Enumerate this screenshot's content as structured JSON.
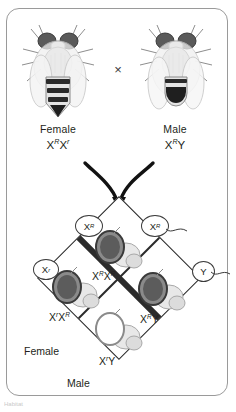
{
  "figure": {
    "cross_symbol": "×",
    "caption_fragment": "Habitat"
  },
  "parents": {
    "female": {
      "sex_label": "Female",
      "allele1": "X",
      "sup1": "R",
      "allele2": "X",
      "sup2": "r",
      "eye_color": "#4a4a4a",
      "icon": "fruit-fly-female"
    },
    "male": {
      "sex_label": "Male",
      "allele1": "X",
      "sup1": "R",
      "allele2": "Y",
      "sup2": "",
      "eye_color": "#4a4a4a",
      "icon": "fruit-fly-male"
    }
  },
  "punnett": {
    "gametes": {
      "top_left": {
        "base": "X",
        "sup": "R"
      },
      "top_right": {
        "base": "X",
        "sup": "R"
      },
      "left": {
        "base": "X",
        "sup": "r"
      },
      "right": {
        "base": "Y",
        "sup": ""
      }
    },
    "cells": {
      "top": {
        "g1": "X",
        "s1": "R",
        "g2": "X",
        "s2": "R",
        "eye": "red"
      },
      "left": {
        "g1": "X",
        "s1": "r",
        "g2": "X",
        "s2": "R",
        "eye": "red"
      },
      "right": {
        "g1": "X",
        "s1": "R",
        "g2": "Y",
        "s2": "",
        "eye": "red"
      },
      "bottom": {
        "g1": "X",
        "s1": "r",
        "g2": "Y",
        "s2": "",
        "eye": "white"
      }
    },
    "sex_labels": {
      "female": "Female",
      "male": "Male"
    }
  },
  "colors": {
    "panel_border": "#9a9a9a",
    "line": "#2b2b2b",
    "red_eye": "#5a5a5a",
    "white_eye": "#ffffff",
    "text": "#231f20"
  }
}
